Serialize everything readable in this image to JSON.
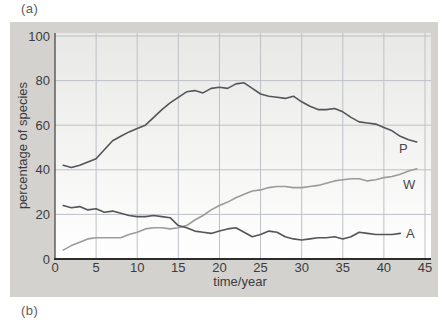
{
  "figure": {
    "label_a": "(a)",
    "label_b": "(b)"
  },
  "colors": {
    "page_bg": "#ffffff",
    "panel_bg": "#d3d2cf",
    "plot_bg_top": "#e8e8e6",
    "plot_bg_bottom": "#ffffff",
    "grid": "#bdc1c6",
    "x_axis": "#2d2d2d",
    "y_axis": "#4a4a4a",
    "text": "#3c3c3c",
    "series_P": "#54555a",
    "series_W": "#9b9c99",
    "series_A": "#54555a"
  },
  "chart_data": {
    "type": "line",
    "title": "",
    "xlabel": "time/year",
    "ylabel": "percentage of species",
    "xlim": [
      0,
      45
    ],
    "ylim": [
      0,
      100
    ],
    "x_ticks": [
      0,
      5,
      10,
      15,
      20,
      25,
      30,
      35,
      40,
      45
    ],
    "y_ticks": [
      0,
      20,
      40,
      60,
      80,
      100
    ],
    "grid": true,
    "legend_position": "inline-end-labels",
    "series": [
      {
        "name": "P",
        "label": "P",
        "color": "#54555a",
        "x": [
          1,
          2,
          3,
          4,
          5,
          6,
          7,
          8,
          9,
          10,
          11,
          12,
          13,
          14,
          15,
          16,
          17,
          18,
          19,
          20,
          21,
          22,
          23,
          24,
          25,
          26,
          27,
          28,
          29,
          30,
          31,
          32,
          33,
          34,
          35,
          36,
          37,
          38,
          39,
          40,
          41,
          42,
          43,
          44
        ],
        "values": [
          42,
          41,
          42,
          43.5,
          45,
          49,
          53,
          55,
          57,
          58.5,
          60,
          63.5,
          67,
          70,
          72.5,
          75,
          75.5,
          74.5,
          76.5,
          77,
          76.5,
          78.5,
          79,
          76.5,
          74,
          73,
          72.5,
          72,
          73,
          70.5,
          68.5,
          67,
          67,
          67.5,
          66,
          63.5,
          61.5,
          61,
          60.5,
          59,
          57.5,
          55,
          53.5,
          52.5
        ]
      },
      {
        "name": "W",
        "label": "W",
        "color": "#9b9c99",
        "x": [
          1,
          2,
          3,
          4,
          5,
          6,
          7,
          8,
          9,
          10,
          11,
          12,
          13,
          14,
          15,
          16,
          17,
          18,
          19,
          20,
          21,
          22,
          23,
          24,
          25,
          26,
          27,
          28,
          29,
          30,
          31,
          32,
          33,
          34,
          35,
          36,
          37,
          38,
          39,
          40,
          41,
          42,
          43,
          44
        ],
        "values": [
          4,
          6,
          7.5,
          9,
          9.5,
          9.5,
          9.5,
          9.5,
          11,
          12,
          13.5,
          14,
          14,
          13.5,
          14,
          15,
          17.5,
          19.5,
          22,
          24,
          25.5,
          27.5,
          29,
          30.5,
          31,
          32,
          32.5,
          32.5,
          32,
          32,
          32.5,
          33,
          34,
          35,
          35.5,
          36,
          36,
          35,
          35.5,
          36.5,
          37,
          38,
          39.5,
          40.5
        ]
      },
      {
        "name": "A",
        "label": "A",
        "color": "#54555a",
        "x": [
          1,
          2,
          3,
          4,
          5,
          6,
          7,
          8,
          9,
          10,
          11,
          12,
          13,
          14,
          15,
          16,
          17,
          18,
          19,
          20,
          21,
          22,
          23,
          24,
          25,
          26,
          27,
          28,
          29,
          30,
          31,
          32,
          33,
          34,
          35,
          36,
          37,
          38,
          39,
          40,
          41,
          42
        ],
        "values": [
          24,
          23,
          23.5,
          22,
          22.5,
          21,
          21.5,
          20.5,
          19.5,
          19,
          19,
          19.5,
          19,
          18.5,
          15,
          14,
          12.5,
          12,
          11.5,
          12.5,
          13.5,
          14,
          12,
          10,
          11,
          12.5,
          12,
          10,
          9,
          8.5,
          9,
          9.5,
          9.5,
          10,
          9,
          10,
          12,
          11.5,
          11,
          11,
          11,
          11.5
        ]
      }
    ]
  }
}
